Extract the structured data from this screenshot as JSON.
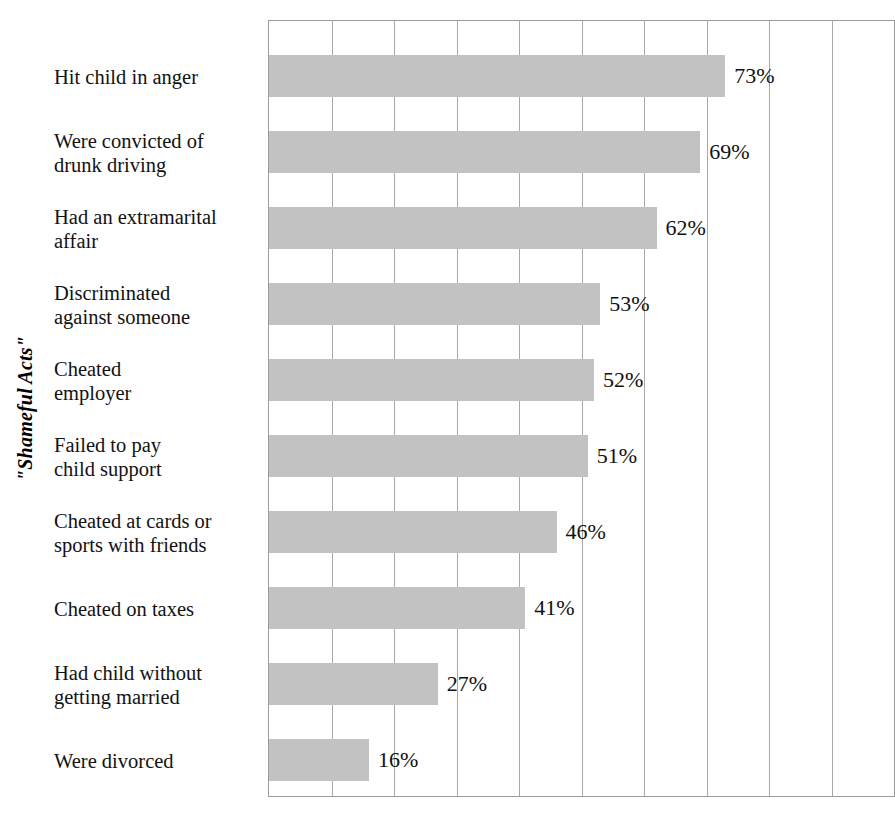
{
  "chart_data": {
    "type": "bar",
    "orientation": "horizontal",
    "title": "",
    "xlabel": "",
    "ylabel": "\"Shameful Acts\"",
    "xlim": [
      0,
      100
    ],
    "xtick_step": 10,
    "xticklabels_shown": false,
    "grid": "vertical",
    "legend": "none",
    "value_label_suffix": "%",
    "bar_color": "#c2c2c2",
    "categories": [
      "Hit child in anger",
      "Were convicted of\ndrunk driving",
      "Had an extramarital\naffair",
      "Discriminated\nagainst someone",
      "Cheated\nemployer",
      "Failed to pay\nchild support",
      "Cheated at cards or\nsports with friends",
      "Cheated on taxes",
      "Had child without\ngetting married",
      "Were divorced"
    ],
    "values": [
      73,
      69,
      62,
      53,
      52,
      51,
      46,
      41,
      27,
      16
    ],
    "value_labels": [
      "73%",
      "69%",
      "62%",
      "53%",
      "52%",
      "51%",
      "46%",
      "41%",
      "27%",
      "16%"
    ]
  },
  "axis": {
    "y_title": "\"Shameful Acts\""
  }
}
